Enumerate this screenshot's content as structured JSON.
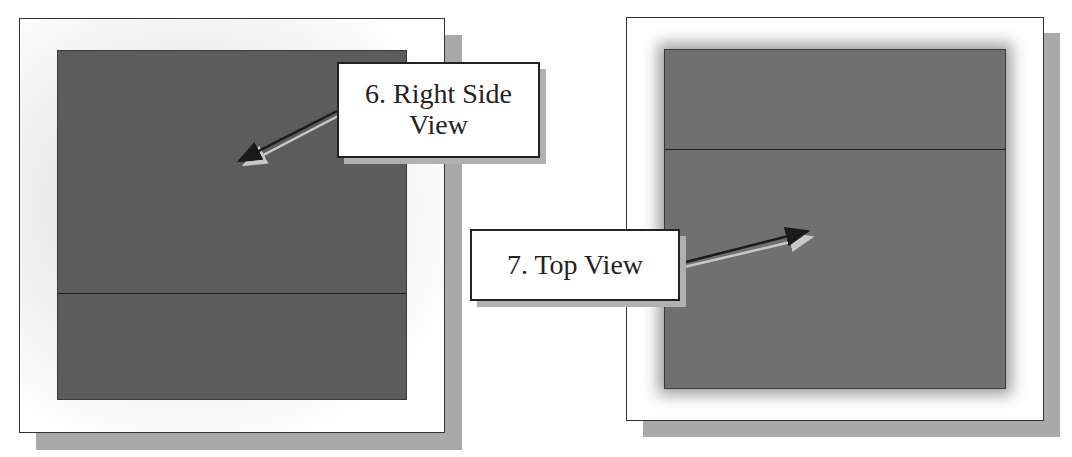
{
  "panels": [
    {
      "name": "right-side-view-panel",
      "callout": {
        "label_line1": "6. Right Side",
        "label_line2": "View"
      },
      "face_color": "#5a5a5a"
    },
    {
      "name": "top-view-panel",
      "callout": {
        "label_line1": "7. Top View"
      },
      "face_color": "#6e6e6e"
    }
  ],
  "colors": {
    "frame_border": "#333333",
    "shadow": "#a9a9a9",
    "arrow_dark": "#1a1a1a",
    "arrow_light": "#c8c8c8"
  }
}
